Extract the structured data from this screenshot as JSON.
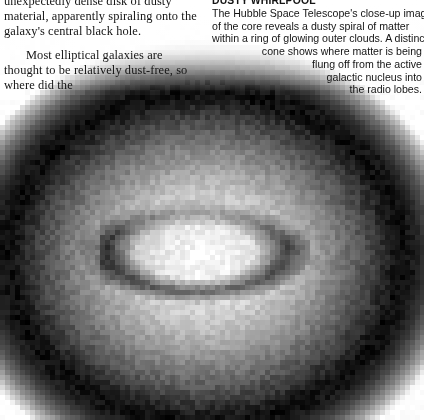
{
  "page": {
    "width": 424,
    "height": 420,
    "background_color": "#ffffff",
    "text_color": "#141414"
  },
  "left_column": {
    "name": "article-body-text",
    "paragraph_1": "unexpectedly dense disk of dusty material, apparently spiraling onto the galaxy's central black hole.",
    "paragraph_2": "Most elliptical galaxies are thought to be relatively dust-free, so where did the"
  },
  "right_column": {
    "heading": "DUSTY WHIRLPOOL",
    "lines": [
      "The Hubble Space Telescope's close-up image",
      "of the core reveals a dusty spiral of matter",
      "within a ring of glowing outer clouds. A distinct",
      "cone shows where matter is being",
      "flung off from the active",
      "galactic nucleus into",
      "the radio lobes."
    ],
    "full_text": "The Hubble Space Telescope's close-up image of the core reveals a dusty spiral of matter within a ring of glowing outer clouds. A distinct cone shows where matter is being flung off from the active galactic nucleus into the radio lobes."
  },
  "figure": {
    "name": "hubble-galaxy-core-image",
    "alt": "Pixelated grayscale Hubble Space Telescope image of an elliptical galaxy core showing a bright glowing bulge crossed by a dark dusty ring with a bright point-like nucleus",
    "style": "pixelated grayscale astronomical photograph",
    "pixel_block_size": 5,
    "colors": {
      "background": "#ffffff",
      "halo_dark": "#0a0a0a",
      "bulge_bright": "#f2f2f2",
      "dust_ring_dark": "#4a4a4a",
      "nucleus": "#ffffff"
    },
    "features": {
      "bright_nucleus": {
        "x": 196,
        "y": 256
      },
      "galaxy_center": {
        "x": 205,
        "y": 258
      },
      "galaxy_radius_x": 200,
      "galaxy_radius_y": 168,
      "dust_ring_center": {
        "x": 196,
        "y": 252
      },
      "dust_ring_radius_x": 104,
      "dust_ring_radius_y": 46
    }
  }
}
